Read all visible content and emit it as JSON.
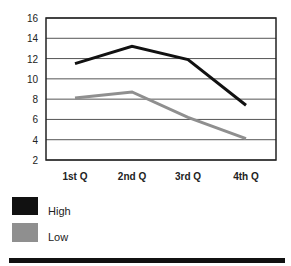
{
  "chart_data": {
    "type": "line",
    "title": "",
    "xlabel": "",
    "ylabel": "",
    "categories": [
      "1st Q",
      "2nd Q",
      "3rd Q",
      "4th Q"
    ],
    "series": [
      {
        "name": "High",
        "color": "#111111",
        "values": [
          11.5,
          13.2,
          11.9,
          7.4
        ]
      },
      {
        "name": "Low",
        "color": "#8f8f8f",
        "values": [
          8.1,
          8.7,
          6.2,
          4.1
        ]
      }
    ],
    "ylim": [
      2,
      16
    ],
    "yticks": [
      2,
      4,
      6,
      8,
      10,
      12,
      14,
      16
    ],
    "grid": true,
    "legend_position": "bottom-left"
  },
  "legend": {
    "items": [
      {
        "label": "High",
        "color": "#111111"
      },
      {
        "label": "Low",
        "color": "#8f8f8f"
      }
    ]
  }
}
